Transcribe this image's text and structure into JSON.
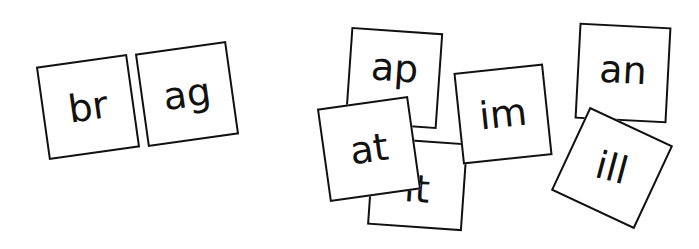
{
  "scene": {
    "description": "Phonics letter cards: onset + rime building",
    "word_group": {
      "cards": [
        {
          "id": "br",
          "label": "br"
        },
        {
          "id": "ag",
          "label": "ag"
        }
      ]
    },
    "scattered_cards": [
      {
        "id": "ap",
        "label": "ap"
      },
      {
        "id": "it",
        "label": "it"
      },
      {
        "id": "at",
        "label": "at"
      },
      {
        "id": "im",
        "label": "im"
      },
      {
        "id": "an",
        "label": "an"
      },
      {
        "id": "ill",
        "label": "ill"
      }
    ]
  }
}
